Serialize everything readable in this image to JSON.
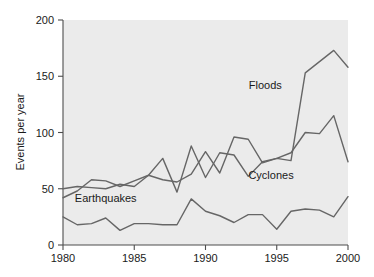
{
  "chart_data": {
    "type": "line",
    "title": "",
    "xlabel": "",
    "ylabel": "Events per year",
    "xlim": [
      1980,
      2000
    ],
    "ylim": [
      0,
      200
    ],
    "xticks": [
      1980,
      1985,
      1990,
      1995,
      2000
    ],
    "yticks": [
      0,
      50,
      100,
      150,
      200
    ],
    "grid": false,
    "legend_position": "inline-annotations",
    "annotations": [
      {
        "text": "Floods",
        "x": 1994.2,
        "y": 139
      },
      {
        "text": "Cyclones",
        "x": 1994.6,
        "y": 59
      },
      {
        "text": "Earthquakes",
        "x": 1983.0,
        "y": 38
      }
    ],
    "x": [
      1980,
      1981,
      1982,
      1983,
      1984,
      1985,
      1986,
      1987,
      1988,
      1989,
      1990,
      1991,
      1992,
      1993,
      1994,
      1995,
      1996,
      1997,
      1998,
      1999,
      2000
    ],
    "series": [
      {
        "name": "Floods",
        "values": [
          50,
          52,
          51,
          50,
          54,
          52,
          62,
          77,
          47,
          88,
          60,
          82,
          80,
          61,
          74,
          77,
          75,
          153,
          163,
          173,
          158
        ]
      },
      {
        "name": "Cyclones",
        "values": [
          42,
          48,
          58,
          57,
          52,
          57,
          62,
          58,
          56,
          63,
          83,
          64,
          96,
          94,
          73,
          77,
          82,
          100,
          99,
          115,
          74
        ]
      },
      {
        "name": "Earthquakes",
        "values": [
          25,
          18,
          19,
          24,
          13,
          19,
          19,
          18,
          18,
          41,
          30,
          26,
          20,
          27,
          27,
          14,
          30,
          32,
          31,
          25,
          43
        ]
      }
    ]
  },
  "axis": {
    "y_title": "Events per year",
    "ytick_labels": [
      "0",
      "50",
      "100",
      "150",
      "200"
    ],
    "xtick_labels": [
      "1980",
      "1985",
      "1990",
      "1995",
      "2000"
    ]
  },
  "colors": {
    "plot_background": "#ebebeb",
    "page_background": "#ffffff",
    "line": "#666666",
    "axis": "#4d4d4d",
    "text": "#1a1a1a"
  }
}
